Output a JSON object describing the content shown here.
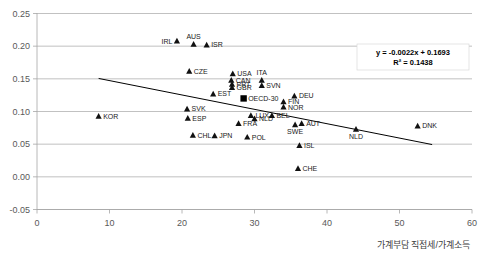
{
  "chart_data": {
    "type": "scatter",
    "title": "",
    "xlabel": "가계부담 직접세/가계소득",
    "ylabel": "",
    "xlim": [
      0,
      60
    ],
    "ylim": [
      -0.05,
      0.25
    ],
    "xticks": [
      "0",
      "10",
      "20",
      "30",
      "40",
      "50",
      "60"
    ],
    "yticks": [
      "0.25",
      "0.20",
      "0.15",
      "0.10",
      "0.05",
      "0.00",
      "-0.05"
    ],
    "grid": true,
    "legend": "none",
    "annotations": {
      "equation": "y = -0.0022x + 0.1693",
      "r2": "R² = 0.1438"
    },
    "trendline": {
      "slope": -0.0022,
      "intercept": 0.1693,
      "x_start": 8.5,
      "x_end": 54.5
    },
    "points": [
      {
        "label": "KOR",
        "x": 8.5,
        "y": 0.093,
        "marker": "triangle",
        "label_pos": "right"
      },
      {
        "label": "IRL",
        "x": 19.3,
        "y": 0.208,
        "marker": "triangle",
        "label_pos": "left"
      },
      {
        "label": "AUS",
        "x": 21.6,
        "y": 0.203,
        "marker": "triangle",
        "label_pos": "above"
      },
      {
        "label": "ISR",
        "x": 23.4,
        "y": 0.202,
        "marker": "triangle",
        "label_pos": "right"
      },
      {
        "label": "CZE",
        "x": 21.0,
        "y": 0.162,
        "marker": "triangle",
        "label_pos": "right"
      },
      {
        "label": "SVK",
        "x": 20.7,
        "y": 0.104,
        "marker": "triangle",
        "label_pos": "right"
      },
      {
        "label": "ESP",
        "x": 20.8,
        "y": 0.09,
        "marker": "triangle",
        "label_pos": "right"
      },
      {
        "label": "CHL",
        "x": 21.5,
        "y": 0.064,
        "marker": "triangle",
        "label_pos": "right"
      },
      {
        "label": "JPN",
        "x": 24.5,
        "y": 0.063,
        "marker": "triangle",
        "label_pos": "right"
      },
      {
        "label": "EST",
        "x": 24.3,
        "y": 0.127,
        "marker": "triangle",
        "label_pos": "right"
      },
      {
        "label": "USA",
        "x": 27.0,
        "y": 0.158,
        "marker": "triangle",
        "label_pos": "right"
      },
      {
        "label": "CAN",
        "x": 26.8,
        "y": 0.148,
        "marker": "triangle",
        "label_pos": "right"
      },
      {
        "label": "PRT",
        "x": 26.9,
        "y": 0.142,
        "marker": "triangle",
        "label_pos": "right"
      },
      {
        "label": "GBR",
        "x": 26.9,
        "y": 0.137,
        "marker": "triangle",
        "label_pos": "right"
      },
      {
        "label": "ITA",
        "x": 31.0,
        "y": 0.148,
        "marker": "triangle",
        "label_pos": "above"
      },
      {
        "label": "SVN",
        "x": 31.0,
        "y": 0.14,
        "marker": "triangle",
        "label_pos": "right"
      },
      {
        "label": "OECD-30",
        "x": 28.5,
        "y": 0.12,
        "marker": "square",
        "label_pos": "right"
      },
      {
        "label": "DEU",
        "x": 35.5,
        "y": 0.124,
        "marker": "triangle",
        "label_pos": "right"
      },
      {
        "label": "FIN",
        "x": 34.0,
        "y": 0.115,
        "marker": "triangle",
        "label_pos": "right"
      },
      {
        "label": "NOR",
        "x": 34.0,
        "y": 0.107,
        "marker": "triangle",
        "label_pos": "right"
      },
      {
        "label": "LUX",
        "x": 29.5,
        "y": 0.094,
        "marker": "triangle",
        "label_pos": "right"
      },
      {
        "label": "NLD",
        "x": 30.0,
        "y": 0.089,
        "marker": "triangle",
        "label_pos": "right"
      },
      {
        "label": "BEL",
        "x": 32.4,
        "y": 0.094,
        "marker": "triangle",
        "label_pos": "right"
      },
      {
        "label": "FRA",
        "x": 27.8,
        "y": 0.082,
        "marker": "triangle",
        "label_pos": "right"
      },
      {
        "label": "AUT",
        "x": 36.5,
        "y": 0.082,
        "marker": "triangle",
        "label_pos": "right"
      },
      {
        "label": "SWE",
        "x": 35.6,
        "y": 0.08,
        "marker": "triangle",
        "label_pos": "below"
      },
      {
        "label": "POL",
        "x": 29.0,
        "y": 0.061,
        "marker": "triangle",
        "label_pos": "right"
      },
      {
        "label": "ISL",
        "x": 36.2,
        "y": 0.048,
        "marker": "triangle",
        "label_pos": "right"
      },
      {
        "label": "CHE",
        "x": 36.0,
        "y": 0.013,
        "marker": "triangle",
        "label_pos": "right"
      },
      {
        "label": "DNK",
        "x": 52.5,
        "y": 0.078,
        "marker": "triangle",
        "label_pos": "right"
      },
      {
        "label": "NLD",
        "x": 44.0,
        "y": 0.073,
        "marker": "triangle",
        "label_pos": "below"
      }
    ]
  }
}
